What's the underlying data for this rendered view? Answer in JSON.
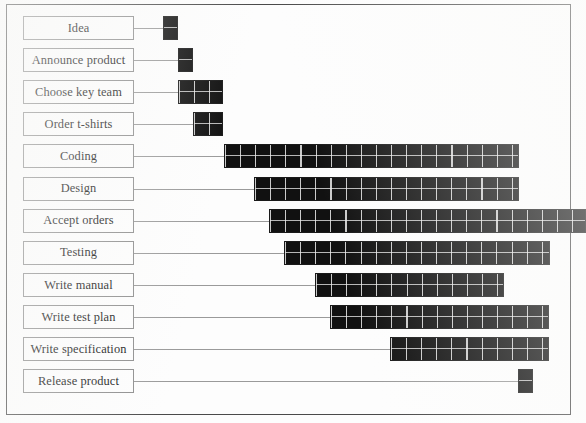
{
  "chart_data": {
    "type": "bar",
    "chart_kind": "gantt",
    "title": "",
    "xlabel": "",
    "ylabel": "",
    "grid": false,
    "legend": "none",
    "unit_px": 15.1,
    "origin_px": 163,
    "axis_note": "horizontal time axis, unlabeled; bars drawn as cell grids of equal-width time units",
    "categories": [
      "Idea",
      "Announce product",
      "Choose key team",
      "Order t-shirts",
      "Coding",
      "Design",
      "Accept orders",
      "Testing",
      "Write manual",
      "Write test plan",
      "Write specification",
      "Release product"
    ],
    "tasks": [
      {
        "name": "Idea",
        "start_unit": 0,
        "duration_units": 1,
        "start_px": 163,
        "width_px": 15,
        "clipped_right": false
      },
      {
        "name": "Announce product",
        "start_unit": 1,
        "duration_units": 1,
        "start_px": 178,
        "width_px": 15,
        "clipped_right": false
      },
      {
        "name": "Choose key team",
        "start_unit": 1,
        "duration_units": 3,
        "start_px": 178,
        "width_px": 45,
        "clipped_right": false
      },
      {
        "name": "Order t-shirts",
        "start_unit": 2,
        "duration_units": 2,
        "start_px": 193,
        "width_px": 30,
        "clipped_right": false
      },
      {
        "name": "Coding",
        "start_unit": 4,
        "duration_units": 20,
        "start_px": 224,
        "width_px": 295,
        "clipped_right": false
      },
      {
        "name": "Design",
        "start_unit": 6,
        "duration_units": 18,
        "start_px": 254,
        "width_px": 265,
        "clipped_right": false
      },
      {
        "name": "Accept orders",
        "start_unit": 7,
        "duration_units": 21,
        "start_px": 269,
        "width_px": 317,
        "clipped_right": true
      },
      {
        "name": "Testing",
        "start_unit": 8,
        "duration_units": 18,
        "start_px": 284,
        "width_px": 266,
        "clipped_right": false
      },
      {
        "name": "Write manual",
        "start_unit": 10,
        "duration_units": 12,
        "start_px": 315,
        "width_px": 189,
        "clipped_right": false
      },
      {
        "name": "Write test plan",
        "start_unit": 11,
        "duration_units": 14,
        "start_px": 330,
        "width_px": 219,
        "clipped_right": false
      },
      {
        "name": "Write specification",
        "start_unit": 15,
        "duration_units": 10,
        "start_px": 390,
        "width_px": 159,
        "clipped_right": false
      },
      {
        "name": "Release product",
        "start_unit": 23,
        "duration_units": 1,
        "start_px": 518,
        "width_px": 15,
        "clipped_right": false
      }
    ]
  },
  "style": {
    "bar_color": "#111111",
    "cell_line_color": "#ebebeb",
    "label_border_color": "#8d8d8d",
    "connector_color": "#9a9a9a",
    "frame_border_color": "#4a4a4a",
    "paper_color": "#fdfdfd",
    "text_color": "#111111"
  }
}
